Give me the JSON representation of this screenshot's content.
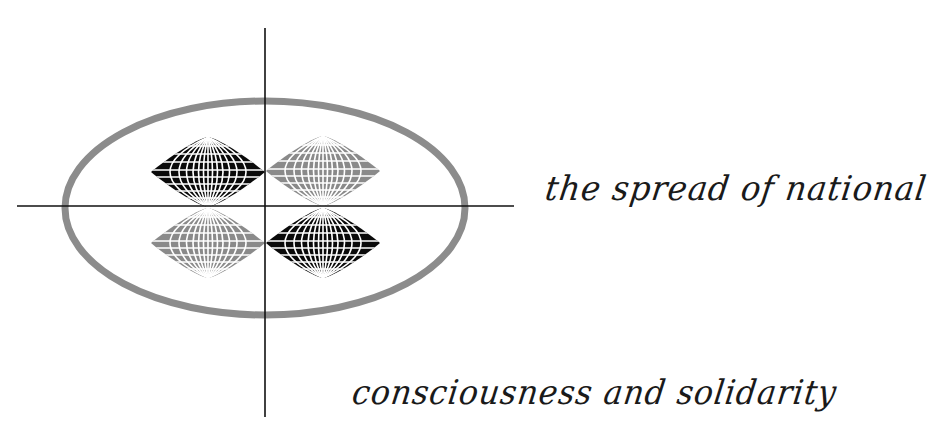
{
  "diagram": {
    "title_lines": [
      "the spread of national",
      "consciousness and solidarity"
    ],
    "elements": {
      "axes": {
        "label": "crosshair-axes",
        "color": "#111111"
      },
      "ellipse": {
        "label": "enclosing-ellipse",
        "color": "#8c8c8c"
      },
      "globes": [
        {
          "position": "top-left",
          "fill": "#0a0a0a"
        },
        {
          "position": "top-right",
          "fill": "#8a8a8a"
        },
        {
          "position": "bottom-left",
          "fill": "#8a8a8a"
        },
        {
          "position": "bottom-right",
          "fill": "#0a0a0a"
        }
      ]
    }
  }
}
